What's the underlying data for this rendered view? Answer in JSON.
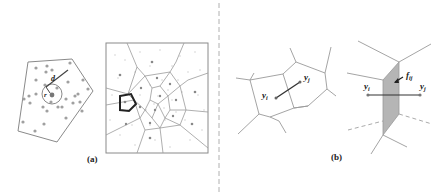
{
  "figure": {
    "panel_a": {
      "caption": "(a)",
      "left_diagram": {
        "label_d": "d",
        "label_r": "r"
      },
      "right_diagram": {
        "description": "Voronoi tessellation of point cloud with one highlighted cell"
      }
    },
    "panel_b": {
      "caption": "(b)",
      "left_diagram": {
        "label_yi": "y",
        "label_yi_sub": "i",
        "label_yj": "y",
        "label_yj_sub": "j"
      },
      "right_diagram": {
        "label_yi": "y",
        "label_yi_sub": "i",
        "label_yj": "y",
        "label_yj_sub": "j",
        "label_face": "f",
        "label_face_sub": "ij"
      }
    },
    "colors": {
      "line": "#8a8a8a",
      "point": "#9a9a9a",
      "highlight": "#222222",
      "face_fill": "#b5b5b5",
      "divider": "#b0b0b0"
    }
  }
}
